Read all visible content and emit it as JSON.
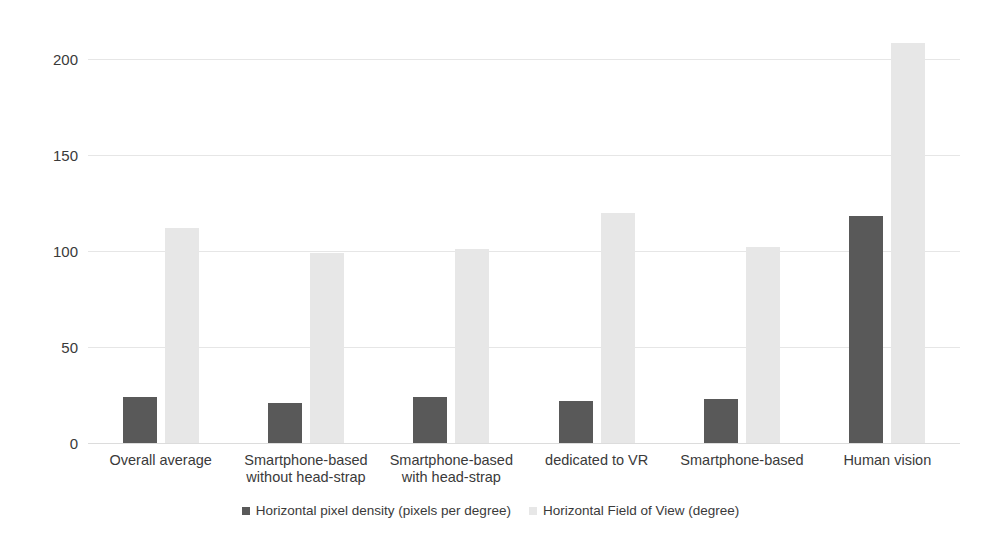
{
  "chart_data": {
    "type": "bar",
    "title": "",
    "subtitle": "",
    "xlabel": "",
    "ylabel": "",
    "ylim": [
      0,
      215
    ],
    "yticks": [
      0,
      50,
      100,
      150,
      200
    ],
    "ytick_labels": [
      "0",
      "50",
      "100",
      "150",
      "200"
    ],
    "grid": true,
    "legend_position": "bottom",
    "categories": [
      "Overall average",
      "Smartphone-based\nwithout head-strap",
      "Smartphone-based\nwith head-strap",
      "dedicated to VR",
      "Smartphone-based",
      "Human vision"
    ],
    "series": [
      {
        "name": "Horizontal pixel density (pixels per degree)",
        "color": "#595959",
        "values": [
          24,
          21,
          24,
          22,
          23,
          118
        ]
      },
      {
        "name": "Horizontal Field of View (degree)",
        "color": "#e7e7e7",
        "values": [
          112,
          99,
          101,
          120,
          102,
          208
        ]
      }
    ]
  },
  "legend": {
    "items": [
      {
        "label": "Horizontal pixel density (pixels per degree)",
        "color": "#595959"
      },
      {
        "label": "Horizontal Field of View (degree)",
        "color": "#e7e7e7"
      }
    ]
  }
}
